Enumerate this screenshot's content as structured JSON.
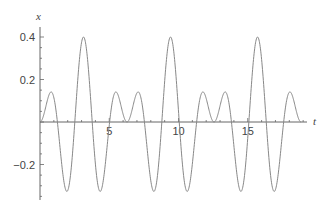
{
  "chart_data": {
    "type": "line",
    "title": "",
    "xlabel": "t",
    "ylabel": "x",
    "xlim": [
      0,
      19.2
    ],
    "ylim": [
      -0.35,
      0.45
    ],
    "grid": false,
    "legend": null,
    "x_ticks": [
      5,
      10,
      15
    ],
    "x_tick_labels": [
      "5",
      "10",
      "15"
    ],
    "y_ticks": [
      0.4,
      0.2,
      -0.2
    ],
    "y_tick_labels": [
      "0.4",
      "0.2",
      "−0.2"
    ],
    "series": [
      {
        "name": "x(t)",
        "function_estimate": "x = 0.2 (cos 2t − cos 3t)",
        "t_range": [
          0,
          18.85
        ],
        "color": "#888888",
        "key_points": [
          {
            "t": 0,
            "x": 0
          },
          {
            "t": 0.78,
            "x": 0.146
          },
          {
            "t": 1.23,
            "x": 0
          },
          {
            "t": 1.97,
            "x": -0.33
          },
          {
            "t": 3.14,
            "x": 0.4
          },
          {
            "t": 4.31,
            "x": -0.33
          },
          {
            "t": 5.5,
            "x": 0.146
          },
          {
            "t": 6.28,
            "x": 0
          },
          {
            "t": 7.07,
            "x": 0.146
          },
          {
            "t": 8.25,
            "x": -0.33
          },
          {
            "t": 9.42,
            "x": 0.4
          },
          {
            "t": 10.6,
            "x": -0.33
          },
          {
            "t": 11.78,
            "x": 0.146
          },
          {
            "t": 12.57,
            "x": 0
          },
          {
            "t": 13.35,
            "x": 0.146
          },
          {
            "t": 14.53,
            "x": -0.33
          },
          {
            "t": 15.71,
            "x": 0.4
          },
          {
            "t": 16.89,
            "x": -0.33
          },
          {
            "t": 18.06,
            "x": 0.146
          },
          {
            "t": 18.85,
            "x": 0
          }
        ]
      }
    ]
  },
  "style": {
    "axis_color": "#666666",
    "curve_color": "#888888",
    "label_color": "#444444"
  },
  "layout": {
    "origin_px": [
      40,
      122
    ],
    "px_per_t": 13.85,
    "px_per_x": 212.5,
    "x_axis_end_px": 307,
    "y_axis_top_px": 27,
    "y_axis_bottom_px": 200
  }
}
